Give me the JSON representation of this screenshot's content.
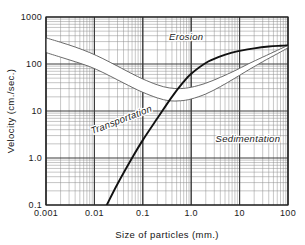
{
  "figure": {
    "background_color": "#ffffff",
    "frame_color": "#222222"
  },
  "chart_data": {
    "type": "line",
    "title": "",
    "subtitle": "",
    "xlabel": "Size of particles (mm.)",
    "ylabel": "Velocity (cm./sec.)",
    "xscale": "log",
    "yscale": "log",
    "xlim": [
      0.001,
      100
    ],
    "ylim": [
      0.1,
      1000
    ],
    "grid": true,
    "grid_style": "log-log minor grid, both axes",
    "legend": "none (inline zone annotations)",
    "x_tick_labels": [
      "0.001",
      "0.01",
      "0.1",
      "1.0",
      "10",
      "100"
    ],
    "x_tick_values": [
      0.001,
      0.01,
      0.1,
      1.0,
      10,
      100
    ],
    "y_tick_labels": [
      "0.1",
      "1.0",
      "10",
      "100",
      "1000"
    ],
    "y_tick_values": [
      0.1,
      1.0,
      10,
      100,
      1000
    ],
    "annotations": [
      {
        "text": "Erosion",
        "x": 0.35,
        "y": 330,
        "rotation": 0,
        "style": "italic"
      },
      {
        "text": "Transportation",
        "x": 0.009,
        "y": 3.2,
        "rotation": -21,
        "style": "italic"
      },
      {
        "text": "Sedimentation",
        "x": 3.2,
        "y": 2.2,
        "rotation": 0,
        "style": "italic"
      }
    ],
    "series": [
      {
        "name": "Erosion band — upper bound (critical erosion velocity, upper envelope)",
        "style": "thin line bounding white band",
        "color": "#5a5a5a",
        "x": [
          0.001,
          0.002,
          0.004,
          0.008,
          0.015,
          0.03,
          0.06,
          0.1,
          0.2,
          0.35,
          0.6,
          1.0,
          2.0,
          4.0,
          8.0,
          15,
          30,
          60,
          100,
          150
        ],
        "y": [
          360,
          290,
          230,
          175,
          130,
          90,
          62,
          48,
          36,
          31,
          30,
          32,
          39,
          52,
          72,
          100,
          140,
          195,
          250,
          300
        ]
      },
      {
        "name": "Erosion band — lower bound (critical erosion velocity, lower envelope)",
        "style": "thin line bounding white band",
        "color": "#5a5a5a",
        "x": [
          0.001,
          0.002,
          0.004,
          0.008,
          0.015,
          0.03,
          0.06,
          0.1,
          0.2,
          0.35,
          0.6,
          1.0,
          2.0,
          4.0,
          8.0,
          15,
          30,
          60,
          100,
          150
        ],
        "y": [
          175,
          140,
          112,
          88,
          66,
          46,
          32,
          25,
          19,
          16.5,
          16.5,
          18,
          23,
          33,
          50,
          74,
          112,
          165,
          220,
          265
        ]
      },
      {
        "name": "Settling / fall velocity (boundary between transportation and sedimentation)",
        "style": "thick solid black line",
        "color": "#111111",
        "x": [
          0.018,
          0.03,
          0.06,
          0.1,
          0.2,
          0.4,
          0.7,
          1.0,
          2.0,
          4.0,
          7.0,
          10,
          20,
          40,
          70,
          100,
          150
        ],
        "y": [
          0.1,
          0.28,
          1.0,
          2.4,
          7.0,
          20,
          42,
          62,
          105,
          145,
          175,
          190,
          215,
          235,
          245,
          250,
          255
        ]
      }
    ]
  },
  "axes": {
    "x_axis": {
      "label": "Size of particles (mm.)",
      "ticks": [
        {
          "label": "0.001",
          "value": 0.001
        },
        {
          "label": "0.01",
          "value": 0.01
        },
        {
          "label": "0.1",
          "value": 0.1
        },
        {
          "label": "1.0",
          "value": 1.0
        },
        {
          "label": "10",
          "value": 10
        },
        {
          "label": "100",
          "value": 100
        }
      ]
    },
    "y_axis": {
      "label": "Velocity (cm./sec.)",
      "ticks": [
        {
          "label": "1000",
          "value": 1000
        },
        {
          "label": "100",
          "value": 100
        },
        {
          "label": "10",
          "value": 10
        },
        {
          "label": "1.0",
          "value": 1.0
        },
        {
          "label": "0.1",
          "value": 0.1
        }
      ]
    }
  },
  "zones": {
    "erosion": "Erosion",
    "transportation": "Transportation",
    "sedimentation": "Sedimentation"
  }
}
